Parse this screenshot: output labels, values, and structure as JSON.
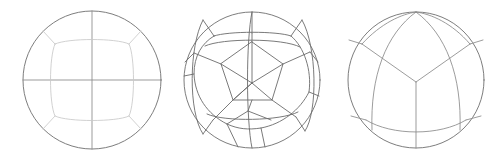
{
  "figure": {
    "background_color": "#ffffff",
    "width": 491,
    "height": 160,
    "stroke_colors": {
      "outline": "#6e6e6e",
      "edge_dark": "#6b6b6b",
      "edge_mid": "#8a8a8a",
      "edge_light": "#c9c9c9",
      "edge_faint": "#d8d8d8"
    }
  },
  "panels": [
    {
      "id": "panel-1",
      "name": "cube-projection",
      "label": "",
      "center": {
        "x": 92,
        "y": 80
      },
      "radius": 69,
      "symmetry": "4-fold",
      "description": "Great-circle cross with inner rounded square and four corner spokes"
    },
    {
      "id": "panel-2",
      "name": "pentagonal-tessellation",
      "label": "",
      "center": {
        "x": 252,
        "y": 80
      },
      "radius": 68,
      "symmetry": "5-fold",
      "description": "Nested pentagonal rings radiating from a central vertex"
    },
    {
      "id": "panel-3",
      "name": "tetrahedral-projection",
      "label": "",
      "center": {
        "x": 416,
        "y": 80
      },
      "radius": 68,
      "symmetry": "3-fold",
      "description": "Three curved spokes from center with outer curved band"
    }
  ],
  "chart_data": {
    "type": "diagram",
    "xlabel": "",
    "ylabel": "",
    "panel_count": 3,
    "panels": [
      {
        "name": "cube-projection",
        "cells": 9,
        "symmetry_order": 4
      },
      {
        "name": "pentagonal-tessellation",
        "cells": 31,
        "symmetry_order": 5
      },
      {
        "name": "tetrahedral-projection",
        "cells": 7,
        "symmetry_order": 3
      }
    ]
  }
}
